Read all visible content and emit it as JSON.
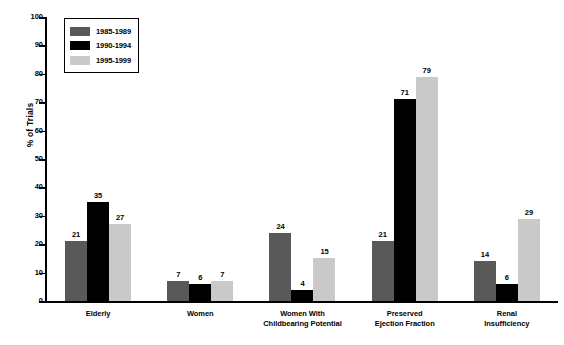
{
  "chart_data": {
    "type": "bar",
    "title": "",
    "xlabel": "",
    "ylabel": "% of Trials",
    "ylim": [
      0,
      100
    ],
    "ytick_step": 10,
    "yticks": [
      100,
      90,
      80,
      70,
      60,
      50,
      40,
      30,
      20,
      10,
      0
    ],
    "grid": false,
    "legend_position": "top-left",
    "categories": [
      "Elderly",
      "Women",
      "Women With\nChildbearing Potential",
      "Preserved\nEjection Fraction",
      "Renal\nInsufficiency"
    ],
    "category_lines": [
      [
        "Elderly"
      ],
      [
        "Women"
      ],
      [
        "Women With",
        "Childbearing Potential"
      ],
      [
        "Preserved",
        "Ejection Fraction"
      ],
      [
        "Renal",
        "Insufficiency"
      ]
    ],
    "series": [
      {
        "name": "1985-1989",
        "color": "#595959",
        "values": [
          21,
          7,
          24,
          21,
          14
        ]
      },
      {
        "name": "1990-1994",
        "color": "#000000",
        "values": [
          35,
          6,
          4,
          71,
          6
        ]
      },
      {
        "name": "1995-1999",
        "color": "#c9c9c9",
        "values": [
          27,
          7,
          15,
          79,
          29
        ]
      }
    ],
    "value_labels_shown": {
      "note": "All bars labeled except the 1995-1999 bars of Elderly and Women groups which are labeled, and 1995-1999 Women value label shown",
      "hidden": []
    }
  },
  "legend": {
    "items": [
      {
        "label": "1985-1989",
        "color": "#595959"
      },
      {
        "label": "1990-1994",
        "color": "#000000"
      },
      {
        "label": "1995-1999",
        "color": "#c9c9c9"
      }
    ]
  },
  "axis": {
    "y_title": "% of Trials"
  }
}
